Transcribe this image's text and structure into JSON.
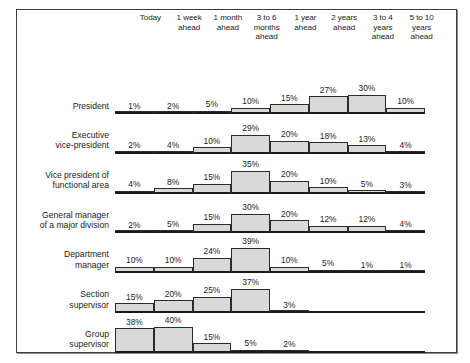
{
  "chart_data": {
    "type": "bar",
    "title": "",
    "xlabel": "",
    "ylabel": "",
    "grid": false,
    "legend_position": "none",
    "orientation": "horizontal-rows-of-histograms",
    "note": "Each management level row is a small histogram across planning-horizon columns; values are percentages of respondents.",
    "categories": [
      "Today",
      "1 week\nahead",
      "1 month\nahead",
      "3 to 6\nmonths\nahead",
      "1 year\nahead",
      "2 years\nahead",
      "3 to 4\nyears\nahead",
      "5 to 10\nyears\nahead"
    ],
    "ylim": [
      0,
      40
    ],
    "series": [
      {
        "name": "President",
        "name_display": "President",
        "values": [
          1,
          2,
          5,
          10,
          15,
          27,
          30,
          10
        ],
        "labels": [
          "1%",
          "2%",
          "5%",
          "10%",
          "15%",
          "27%",
          "30%",
          "10%"
        ]
      },
      {
        "name": "Executive vice-president",
        "name_display": "Executive\nvice-president",
        "values": [
          2,
          4,
          10,
          29,
          20,
          18,
          13,
          4
        ],
        "labels": [
          "2%",
          "4%",
          "10%",
          "29%",
          "20%",
          "18%",
          "13%",
          "4%"
        ]
      },
      {
        "name": "Vice president of functional area",
        "name_display": "Vice president of\nfunctional area",
        "values": [
          4,
          8,
          15,
          35,
          20,
          10,
          5,
          3
        ],
        "labels": [
          "4%",
          "8%",
          "15%",
          "35%",
          "20%",
          "10%",
          "5%",
          "3%"
        ]
      },
      {
        "name": "General manager of a major division",
        "name_display": "General manager\nof a major division",
        "values": [
          2,
          5,
          15,
          30,
          20,
          12,
          12,
          4
        ],
        "labels": [
          "2%",
          "5%",
          "15%",
          "30%",
          "20%",
          "12%",
          "12%",
          "4%"
        ]
      },
      {
        "name": "Department manager",
        "name_display": "Department\nmanager",
        "values": [
          10,
          10,
          24,
          39,
          10,
          5,
          1,
          1
        ],
        "labels": [
          "10%",
          "10%",
          "24%",
          "39%",
          "10%",
          "5%",
          "1%",
          "1%"
        ]
      },
      {
        "name": "Section supervisor",
        "name_display": "Section\nsupervisor",
        "values": [
          15,
          20,
          25,
          37,
          3,
          0,
          0,
          0
        ],
        "labels": [
          "15%",
          "20%",
          "25%",
          "37%",
          "3%",
          "",
          "",
          ""
        ]
      },
      {
        "name": "Group supervisor",
        "name_display": "Group\nsupervisor",
        "values": [
          38,
          40,
          15,
          5,
          2,
          0,
          0,
          0
        ],
        "labels": [
          "38%",
          "40%",
          "15%",
          "5%",
          "2%",
          "",
          "",
          ""
        ]
      }
    ],
    "colors": {
      "bar_fill": "#d9d9d9",
      "bar_stroke": "#2b2b2b",
      "baseline": "#4a4a4a",
      "text": "#1c1c1c",
      "frame": "#3c3c3c",
      "background": "#ffffff"
    }
  }
}
